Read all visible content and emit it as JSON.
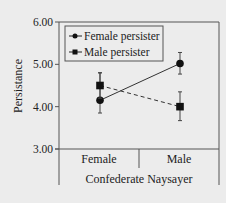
{
  "chart_data": {
    "type": "line",
    "title": "",
    "xlabel": "Confederate Naysayer",
    "ylabel": "Persistance",
    "categories": [
      "Female",
      "Male"
    ],
    "ylim": [
      3.0,
      6.0
    ],
    "yticks": [
      "3.00",
      "4.00",
      "5.00",
      "6.00"
    ],
    "ytick_values": [
      3.0,
      4.0,
      5.0,
      6.0
    ],
    "grid": false,
    "legend_position": "top-left",
    "series": [
      {
        "name": "Female persister",
        "marker": "circle",
        "line_style": "solid",
        "values": [
          4.15,
          5.02
        ],
        "error_upper": [
          4.8,
          5.28
        ],
        "error_lower": [
          3.85,
          4.77
        ]
      },
      {
        "name": "Male persister",
        "marker": "square",
        "line_style": "dashed",
        "values": [
          4.5,
          4.0
        ],
        "error_upper": [
          4.8,
          4.35
        ],
        "error_lower": [
          4.2,
          3.67
        ]
      }
    ]
  },
  "colors": {
    "background": "#ececec",
    "ink": "#222222",
    "axis": "#555555"
  }
}
